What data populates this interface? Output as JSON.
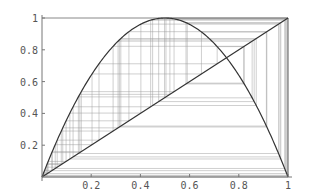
{
  "chart_data": {
    "type": "line",
    "title": "",
    "xlabel": "",
    "ylabel": "",
    "xlim": [
      0,
      1
    ],
    "ylim": [
      0,
      1
    ],
    "grid": false,
    "legend": null,
    "x_ticks": [
      "0.2",
      "0.4",
      "0.6",
      "0.8",
      "1"
    ],
    "y_ticks": [
      "0.2",
      "0.4",
      "0.6",
      "0.8",
      "1"
    ],
    "series": [
      {
        "name": "logistic map f(x)=4x(1-x)",
        "kind": "curve",
        "r": 4
      },
      {
        "name": "identity y=x",
        "kind": "line"
      },
      {
        "name": "cobweb iterations",
        "kind": "cobweb",
        "x0": 0.02,
        "iterations": 60
      }
    ],
    "annotations": []
  },
  "colors": {
    "curve": "#333333",
    "diagonal": "#333333",
    "cobweb": "#9a9a9a",
    "axis": "#777777",
    "frame": "#888888"
  },
  "layout": {
    "x0px": 42,
    "x1px": 288,
    "y0px": 177,
    "y1px": 18
  }
}
